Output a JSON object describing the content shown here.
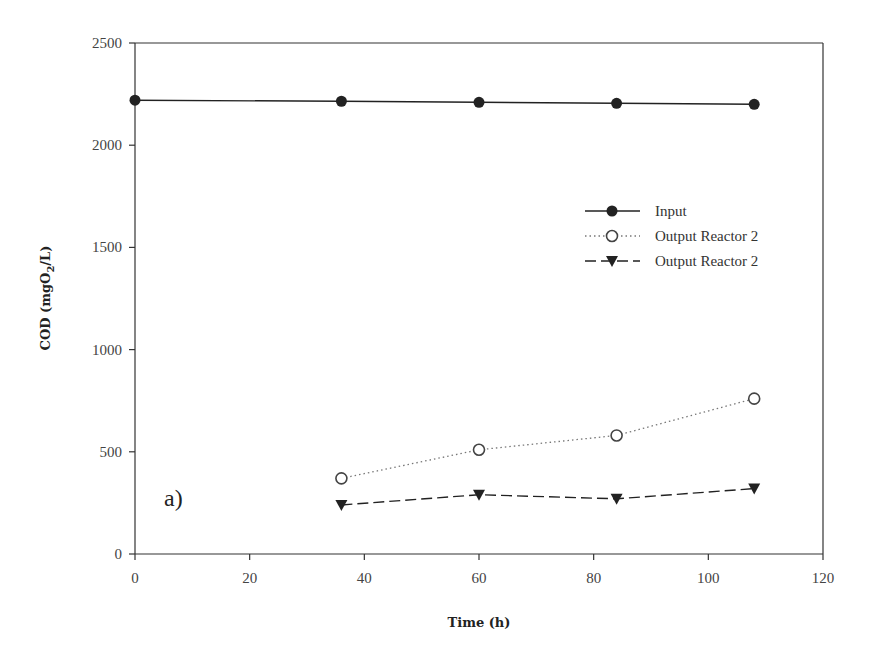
{
  "chart_data": {
    "type": "line",
    "title": "",
    "xlabel": "Time (h)",
    "ylabel": "COD (mgO2/L)",
    "ylabel_parts": {
      "main": "COD (mgO",
      "sub": "2",
      "tail": "/L)"
    },
    "xlim": [
      0,
      120
    ],
    "ylim": [
      0,
      2500
    ],
    "xticks": [
      0,
      20,
      40,
      60,
      80,
      100,
      120
    ],
    "yticks": [
      0,
      500,
      1000,
      1500,
      2000,
      2500
    ],
    "grid": false,
    "legend_position": "upper right (inside)",
    "annotation": "a)",
    "series": [
      {
        "name": "Input",
        "marker": "filled-circle",
        "line": "solid",
        "x": [
          0,
          36,
          60,
          84,
          108
        ],
        "values": [
          2220,
          2215,
          2210,
          2205,
          2200
        ]
      },
      {
        "name": "Output Reactor 2",
        "marker": "open-circle",
        "line": "dotted",
        "x": [
          36,
          60,
          84,
          108
        ],
        "values": [
          370,
          510,
          580,
          760
        ]
      },
      {
        "name": "Output Reactor 2",
        "marker": "filled-triangle-down",
        "line": "dashed",
        "x": [
          36,
          60,
          84,
          108
        ],
        "values": [
          240,
          290,
          270,
          320
        ]
      }
    ]
  },
  "colors": {
    "axis": "#333333",
    "series": "#222222"
  }
}
